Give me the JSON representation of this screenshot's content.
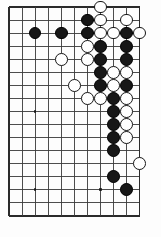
{
  "figure": {
    "kind": "go-board-diagram",
    "board_label": "Go game board"
  },
  "board": {
    "width_px": 161,
    "height_px": 237,
    "origin_x": 9,
    "origin_y": 7,
    "spacing": 13.05,
    "columns": 11,
    "rows": 17,
    "line_color": "#3a3a3a",
    "border_color": "#2b2b2b",
    "background_color": "#fdfdfd",
    "black_color": "#171717",
    "white_color": "#ffffff",
    "stone_radius": 6.4,
    "column_labels": [
      "1",
      "2",
      "3",
      "4",
      "5",
      "6",
      "7",
      "8",
      "9",
      "10",
      "11"
    ],
    "row_labels": [
      "1",
      "2",
      "3",
      "4",
      "5",
      "6",
      "7",
      "8",
      "9",
      "10",
      "11",
      "12",
      "13",
      "14",
      "15",
      "16",
      "17"
    ]
  },
  "hoshi": [
    {
      "col": 2,
      "row": 2,
      "name": "hoshi-upper-left"
    },
    {
      "col": 7,
      "row": 2,
      "name": "hoshi-upper-right"
    },
    {
      "col": 2,
      "row": 8,
      "name": "hoshi-middle-left"
    },
    {
      "col": 2,
      "row": 14,
      "name": "hoshi-lower-left"
    },
    {
      "col": 7,
      "row": 14,
      "name": "hoshi-lower-right"
    }
  ],
  "stones": [
    {
      "color": "white",
      "col": 7,
      "row": 0,
      "label": "W-g1"
    },
    {
      "color": "black",
      "col": 6,
      "row": 1,
      "label": "B-f2"
    },
    {
      "color": "white",
      "col": 7,
      "row": 1,
      "label": "W-g2"
    },
    {
      "color": "white",
      "col": 9,
      "row": 1,
      "label": "W-i2"
    },
    {
      "color": "black",
      "col": 2,
      "row": 2,
      "label": "B-b3"
    },
    {
      "color": "black",
      "col": 4,
      "row": 2,
      "label": "B-d3"
    },
    {
      "color": "black",
      "col": 6,
      "row": 2,
      "label": "B-f3"
    },
    {
      "color": "white",
      "col": 7,
      "row": 2,
      "label": "W-g3"
    },
    {
      "color": "white",
      "col": 8,
      "row": 2,
      "label": "W-h3"
    },
    {
      "color": "black",
      "col": 9,
      "row": 2,
      "label": "B-i3"
    },
    {
      "color": "white",
      "col": 10,
      "row": 2,
      "label": "W-j3"
    },
    {
      "color": "white",
      "col": 6,
      "row": 3,
      "label": "W-f4"
    },
    {
      "color": "black",
      "col": 7,
      "row": 3,
      "label": "B-g4"
    },
    {
      "color": "black",
      "col": 9,
      "row": 3,
      "label": "B-i4"
    },
    {
      "color": "white",
      "col": 4,
      "row": 4,
      "label": "W-d5"
    },
    {
      "color": "white",
      "col": 6,
      "row": 4,
      "label": "W-f5"
    },
    {
      "color": "black",
      "col": 7,
      "row": 4,
      "label": "B-g5"
    },
    {
      "color": "black",
      "col": 9,
      "row": 4,
      "label": "B-i5"
    },
    {
      "color": "black",
      "col": 7,
      "row": 5,
      "label": "B-g6"
    },
    {
      "color": "white",
      "col": 8,
      "row": 5,
      "label": "W-h6"
    },
    {
      "color": "white",
      "col": 9,
      "row": 5,
      "label": "W-i6"
    },
    {
      "color": "white",
      "col": 5,
      "row": 6,
      "label": "W-e7"
    },
    {
      "color": "black",
      "col": 7,
      "row": 6,
      "label": "B-g7"
    },
    {
      "color": "white",
      "col": 8,
      "row": 6,
      "label": "W-h7"
    },
    {
      "color": "black",
      "col": 9,
      "row": 6,
      "label": "B-i7"
    },
    {
      "color": "white",
      "col": 6,
      "row": 7,
      "label": "W-f8"
    },
    {
      "color": "white",
      "col": 7,
      "row": 7,
      "label": "W-g8"
    },
    {
      "color": "black",
      "col": 8,
      "row": 7,
      "label": "B-h8"
    },
    {
      "color": "white",
      "col": 9,
      "row": 7,
      "label": "W-i8"
    },
    {
      "color": "black",
      "col": 8,
      "row": 8,
      "label": "B-h9"
    },
    {
      "color": "white",
      "col": 9,
      "row": 8,
      "label": "W-i9"
    },
    {
      "color": "black",
      "col": 8,
      "row": 9,
      "label": "B-h10"
    },
    {
      "color": "white",
      "col": 9,
      "row": 9,
      "label": "W-i10"
    },
    {
      "color": "black",
      "col": 8,
      "row": 10,
      "label": "B-h11"
    },
    {
      "color": "white",
      "col": 9,
      "row": 10,
      "label": "W-i11"
    },
    {
      "color": "black",
      "col": 8,
      "row": 11,
      "label": "B-h12"
    },
    {
      "color": "white",
      "col": 10,
      "row": 12,
      "label": "W-j13"
    },
    {
      "color": "black",
      "col": 8,
      "row": 13,
      "label": "B-h14"
    },
    {
      "color": "black",
      "col": 9,
      "row": 14,
      "label": "B-i15"
    }
  ]
}
